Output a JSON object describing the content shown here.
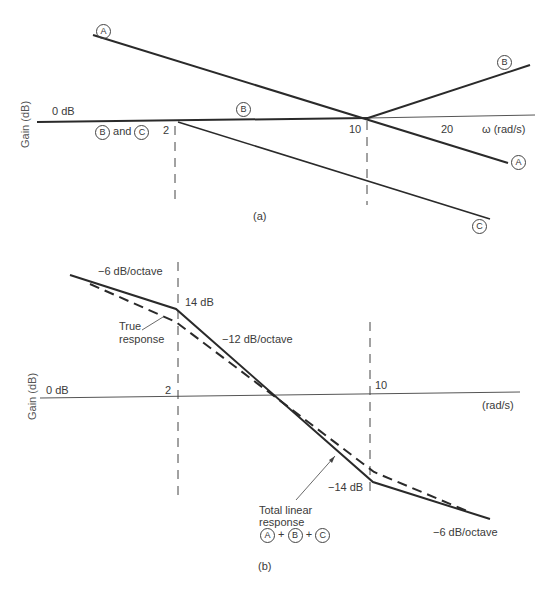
{
  "figure_a": {
    "caption": "(a)",
    "y_axis_label": "Gain (dB)",
    "zero_label": "0 dB",
    "x_axis_label": "ω (rad/s)",
    "ticks": [
      "2",
      "10",
      "20"
    ],
    "curve_labels": {
      "A": "A",
      "B": "B",
      "C": "C"
    },
    "b_and_c": {
      "b": "B",
      "and": "and",
      "c": "C"
    }
  },
  "figure_b": {
    "caption": "(b)",
    "y_axis_label": "Gain (dB)",
    "zero_label": "0 dB",
    "x_axis_label": "(rad/s)",
    "ticks": [
      "2",
      "10"
    ],
    "annotations": {
      "slope_low": "−6 dB/octave",
      "gain_14": "14 dB",
      "slope_mid": "−12 dB/octave",
      "true_response_1": "True",
      "true_response_2": "response",
      "gain_minus_14": "−14 dB",
      "total_1": "Total linear",
      "total_2": "response",
      "sum": {
        "a": "A",
        "plus1": "+",
        "b": "B",
        "plus2": "+",
        "c": "C"
      },
      "slope_high": "−6 dB/octave"
    }
  },
  "colors": {
    "line": "#2a2a2a",
    "axis": "#555555",
    "text": "#3a3a3a"
  }
}
